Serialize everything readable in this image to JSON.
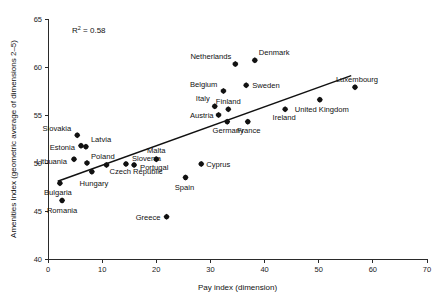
{
  "chart_data": {
    "type": "scatter",
    "title": "",
    "xlabel": "Pay index (dimension)",
    "ylabel": "Amenities Index (geometric average of dimensions 2–5)",
    "xlim": [
      0,
      70
    ],
    "ylim": [
      40,
      65
    ],
    "xticks": [
      0,
      10,
      20,
      30,
      40,
      50,
      60,
      70
    ],
    "yticks": [
      40,
      45,
      50,
      55,
      60,
      65
    ],
    "grid": false,
    "legend": "none",
    "annotation": {
      "r_squared_prefix": "R",
      "r_squared_sup": "2",
      "r_squared_value": "= 0.58",
      "full_text": "R2 = 0.58"
    },
    "trendline": {
      "label": "linear-fit",
      "x_start": 1.8,
      "y_start": 48.1,
      "x_end": 56.0,
      "y_end": 59.1
    },
    "points": [
      {
        "label": "Bulgaria",
        "x": 2.2,
        "y": 47.9,
        "label_dx": -2,
        "label_dy": 12,
        "anchor": "middle"
      },
      {
        "label": "Romania",
        "x": 2.6,
        "y": 46.1,
        "label_dx": 0,
        "label_dy": 13,
        "anchor": "middle"
      },
      {
        "label": "Lithuania",
        "x": 4.8,
        "y": 50.4,
        "label_dx": -7,
        "label_dy": 5,
        "anchor": "end"
      },
      {
        "label": "Slovakia",
        "x": 5.4,
        "y": 52.9,
        "label_dx": -6,
        "label_dy": -4,
        "anchor": "end"
      },
      {
        "label": "Estonia",
        "x": 6.1,
        "y": 51.8,
        "label_dx": -6,
        "label_dy": 4,
        "anchor": "end"
      },
      {
        "label": "Latvia",
        "x": 7.0,
        "y": 51.7,
        "label_dx": 5,
        "label_dy": -5,
        "anchor": "start"
      },
      {
        "label": "Poland",
        "x": 7.2,
        "y": 50.0,
        "label_dx": 4,
        "label_dy": -4,
        "anchor": "start"
      },
      {
        "label": "Hungary",
        "x": 8.1,
        "y": 49.1,
        "label_dx": 2,
        "label_dy": 14,
        "anchor": "middle"
      },
      {
        "label": "Czech Republic",
        "x": 10.8,
        "y": 49.8,
        "label_dx": 3,
        "label_dy": 9,
        "anchor": "start"
      },
      {
        "label": "Slovenia",
        "x": 14.4,
        "y": 49.9,
        "label_dx": 6,
        "label_dy": -3,
        "anchor": "start"
      },
      {
        "label": "Portugal",
        "x": 15.9,
        "y": 49.8,
        "label_dx": 6,
        "label_dy": 5,
        "anchor": "start"
      },
      {
        "label": "Malta",
        "x": 20.0,
        "y": 50.4,
        "label_dx": 0,
        "label_dy": -6,
        "anchor": "middle"
      },
      {
        "label": "Greece",
        "x": 21.9,
        "y": 44.4,
        "label_dx": -6,
        "label_dy": 3,
        "anchor": "end"
      },
      {
        "label": "Spain",
        "x": 25.4,
        "y": 48.5,
        "label_dx": -1,
        "label_dy": 13,
        "anchor": "middle"
      },
      {
        "label": "Cyprus",
        "x": 28.3,
        "y": 49.9,
        "label_dx": 5,
        "label_dy": 3,
        "anchor": "start"
      },
      {
        "label": "Italy",
        "x": 30.8,
        "y": 55.9,
        "label_dx": -5,
        "label_dy": -5,
        "anchor": "end"
      },
      {
        "label": "Austria",
        "x": 31.5,
        "y": 55.0,
        "label_dx": -5,
        "label_dy": 3,
        "anchor": "end"
      },
      {
        "label": "Belgium",
        "x": 32.4,
        "y": 57.5,
        "label_dx": -6,
        "label_dy": -4,
        "anchor": "end"
      },
      {
        "label": "Finland",
        "x": 33.3,
        "y": 55.6,
        "label_dx": 0,
        "label_dy": -5,
        "anchor": "middle"
      },
      {
        "label": "Germany",
        "x": 33.1,
        "y": 54.3,
        "label_dx": 1,
        "label_dy": 11,
        "anchor": "middle"
      },
      {
        "label": "Netherlands",
        "x": 34.6,
        "y": 60.3,
        "label_dx": -4,
        "label_dy": -5,
        "anchor": "end"
      },
      {
        "label": "Sweden",
        "x": 36.6,
        "y": 58.1,
        "label_dx": 6,
        "label_dy": 3,
        "anchor": "start"
      },
      {
        "label": "France",
        "x": 36.9,
        "y": 54.3,
        "label_dx": 1,
        "label_dy": 11,
        "anchor": "middle"
      },
      {
        "label": "Denmark",
        "x": 38.2,
        "y": 60.7,
        "label_dx": 4,
        "label_dy": -5,
        "anchor": "start"
      },
      {
        "label": "Ireland",
        "x": 43.8,
        "y": 55.6,
        "label_dx": -1,
        "label_dy": 11,
        "anchor": "middle"
      },
      {
        "label": "United Kingdom",
        "x": 50.2,
        "y": 56.6,
        "label_dx": 2,
        "label_dy": 12,
        "anchor": "middle"
      },
      {
        "label": "Luxembourg",
        "x": 56.7,
        "y": 57.9,
        "label_dx": 2,
        "label_dy": -5,
        "anchor": "middle"
      }
    ]
  }
}
